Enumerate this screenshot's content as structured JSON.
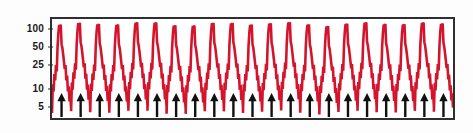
{
  "chart_data": {
    "type": "line",
    "title": "",
    "subtitle": "",
    "xlabel": "",
    "ylabel": "",
    "yscale": "log",
    "ylim": [
      3,
      160
    ],
    "ytick_values": [
      100,
      50,
      25,
      10,
      5
    ],
    "ytick_labels": [
      "100",
      "50",
      "25",
      "10",
      "5"
    ],
    "xlim": [
      0,
      21
    ],
    "xtick_labels": [],
    "grid": false,
    "legend": null,
    "series": [
      {
        "name": "viral-load",
        "color": "#D4142C",
        "line_width": 2.6,
        "description": "repeating sawtooth rebound cycles on log scale",
        "cycles": 21,
        "cycle_profile": [
          3.8,
          12,
          9,
          18,
          14,
          26,
          20,
          55,
          95,
          130,
          120,
          132,
          60,
          52,
          40,
          30,
          22,
          26,
          14,
          17,
          9,
          11,
          6,
          8,
          4.5
        ],
        "peak_value": 132,
        "trough_value": 3.8
      }
    ],
    "annotations": {
      "markers": {
        "name": "dose-arrows",
        "symbol": "arrow-up",
        "color": "#111111",
        "count": 21,
        "positions": [
          0.5,
          1.5,
          2.5,
          3.5,
          4.5,
          5.5,
          6.5,
          7.5,
          8.5,
          9.5,
          10.5,
          11.5,
          12.5,
          13.5,
          14.5,
          15.5,
          16.5,
          17.5,
          18.5,
          19.5,
          20.5
        ]
      }
    }
  },
  "figure": {
    "background_color": "#fdfdfd",
    "frame_color": "#2f2f2f",
    "accent_color": "#D4142C",
    "marker_color": "#111111"
  }
}
